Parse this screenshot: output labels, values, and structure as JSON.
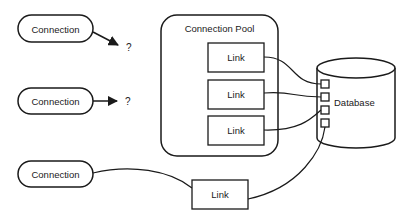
{
  "diagram": {
    "connections": [
      {
        "label": "Connection",
        "target": "?"
      },
      {
        "label": "Connection",
        "target": "?"
      },
      {
        "label": "Connection"
      }
    ],
    "pool": {
      "title": "Connection Pool",
      "links": [
        {
          "label": "Link"
        },
        {
          "label": "Link"
        },
        {
          "label": "Link"
        }
      ]
    },
    "external_link": {
      "label": "Link"
    },
    "database": {
      "label": "Database"
    },
    "colors": {
      "stroke": "#1a1a1a",
      "background": "#ffffff"
    }
  }
}
